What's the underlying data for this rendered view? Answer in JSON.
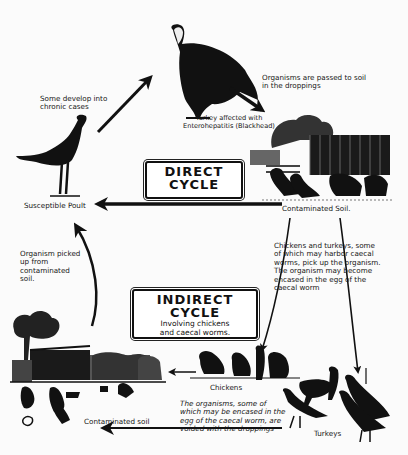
{
  "diagram": {
    "direct_cycle": {
      "title_line1": "DIRECT",
      "title_line2": "CYCLE"
    },
    "indirect_cycle": {
      "title_line1": "INDIRECT",
      "title_line2": "CYCLE",
      "subtitle": "Involving chickens\nand caecal worms."
    },
    "labels": {
      "affected_turkey": "Turkey affected with\nEnterohepatitis (Blackhead)",
      "passed_to_soil": "Organisms are passed to soil\nin the droppings",
      "chronic": "Some develop into\nchronic cases",
      "susceptible_poult": "Susceptible Poult",
      "contaminated_soil_direct": "Contaminated Soil.",
      "chickens_turkeys_note": "Chickens and turkeys, some\nof which may harbor caecal\nworms, pick up the organism.\nThe organism may become\nencased in the egg of the\ncaecal worm",
      "organism_picked_up": "Organism picked\nup from\ncontaminated\nsoil.",
      "chickens": "Chickens",
      "organisms_voided": "The organisms, some of\nwhich may be encased in the\negg of the caecal worm, are\nvoided with the droppings",
      "turkeys": "Turkeys",
      "contaminated_soil_indirect": "Contaminated soil"
    },
    "nodes": [
      {
        "id": "affected-turkey",
        "label": "Turkey affected with Enterohepatitis (Blackhead)"
      },
      {
        "id": "contaminated-soil-direct",
        "label": "Contaminated Soil."
      },
      {
        "id": "susceptible-poult",
        "label": "Susceptible Poult"
      },
      {
        "id": "chickens",
        "label": "Chickens"
      },
      {
        "id": "turkeys",
        "label": "Turkeys"
      },
      {
        "id": "contaminated-soil-indirect",
        "label": "Contaminated soil"
      }
    ],
    "edges": [
      {
        "from": "affected-turkey",
        "to": "contaminated-soil-direct",
        "label": "Organisms are passed to soil in the droppings"
      },
      {
        "from": "contaminated-soil-direct",
        "to": "susceptible-poult",
        "label": "DIRECT CYCLE"
      },
      {
        "from": "susceptible-poult",
        "to": "affected-turkey",
        "label": "Some develop into chronic cases"
      },
      {
        "from": "contaminated-soil-direct",
        "to": "chickens",
        "label": "Chickens and turkeys pick up the organism"
      },
      {
        "from": "contaminated-soil-direct",
        "to": "turkeys",
        "label": ""
      },
      {
        "from": "chickens",
        "to": "contaminated-soil-indirect",
        "label": "voided with the droppings"
      },
      {
        "from": "contaminated-soil-indirect",
        "to": "susceptible-poult",
        "label": "Organism picked up from contaminated soil."
      }
    ],
    "colors": {
      "ink": "#111111",
      "paper": "#fbfbfb"
    }
  }
}
